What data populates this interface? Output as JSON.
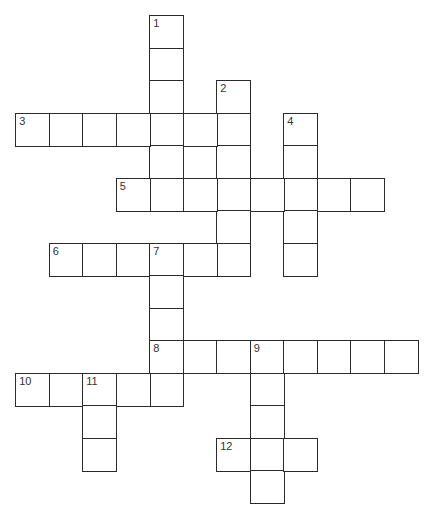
{
  "puzzle": {
    "type": "crossword",
    "grid": {
      "origin_x": 16,
      "origin_y": 16,
      "cell_w": 33.5,
      "cell_h": 32.5,
      "line_color": "#2b2b2b"
    },
    "entries": [
      {
        "number": "1",
        "direction": "down",
        "row": 0,
        "col": 4,
        "length": 6
      },
      {
        "number": "2",
        "direction": "down",
        "row": 2,
        "col": 6,
        "length": 6
      },
      {
        "number": "3",
        "direction": "across",
        "row": 3,
        "col": 0,
        "length": 7
      },
      {
        "number": "4",
        "direction": "down",
        "row": 3,
        "col": 8,
        "length": 5
      },
      {
        "number": "5",
        "direction": "across",
        "row": 5,
        "col": 3,
        "length": 8
      },
      {
        "number": "6",
        "direction": "across",
        "row": 7,
        "col": 1,
        "length": 6
      },
      {
        "number": "7",
        "direction": "down",
        "row": 7,
        "col": 4,
        "length": 5
      },
      {
        "number": "8",
        "direction": "across",
        "row": 10,
        "col": 4,
        "length": 8
      },
      {
        "number": "9",
        "direction": "down",
        "row": 10,
        "col": 7,
        "length": 5
      },
      {
        "number": "10",
        "direction": "across",
        "row": 11,
        "col": 0,
        "length": 5
      },
      {
        "number": "11",
        "direction": "down",
        "row": 11,
        "col": 2,
        "length": 3
      },
      {
        "number": "12",
        "direction": "across",
        "row": 13,
        "col": 6,
        "length": 3
      }
    ]
  }
}
